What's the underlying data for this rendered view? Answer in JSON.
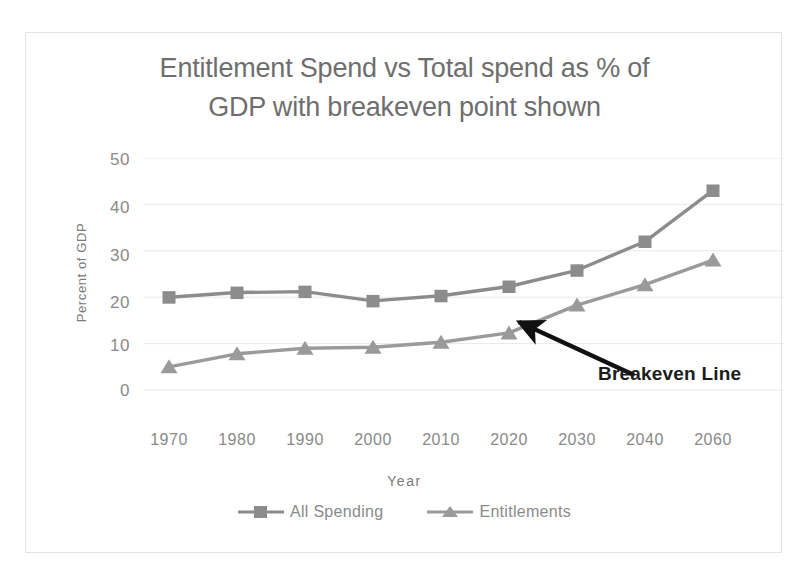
{
  "chart_data": {
    "type": "line",
    "title": "Entitlement Spend vs Total spend as % of GDP with breakeven point shown",
    "title_line1": "Entitlement Spend vs Total spend as % of",
    "title_line2": "GDP with breakeven point shown",
    "xlabel": "Year",
    "ylabel": "Percent of GDP",
    "categories": [
      "1970",
      "1980",
      "1990",
      "2000",
      "2010",
      "2020",
      "2030",
      "2040",
      "2060"
    ],
    "ylim": [
      0,
      50
    ],
    "yticks": [
      "50",
      "40",
      "30",
      "20",
      "10",
      "0"
    ],
    "ytick_values": [
      50,
      40,
      30,
      20,
      10,
      0
    ],
    "grid": true,
    "legend_position": "bottom",
    "series": [
      {
        "name": "All Spending",
        "marker": "square",
        "color": "#8c8c8c",
        "values": [
          20.0,
          21.0,
          21.2,
          19.2,
          20.3,
          22.3,
          25.8,
          32.0,
          43.0
        ]
      },
      {
        "name": "Entitlements",
        "marker": "triangle",
        "color": "#9a9a9a",
        "values": [
          5.0,
          7.8,
          9.0,
          9.2,
          10.3,
          12.3,
          18.3,
          22.7,
          28.0
        ]
      }
    ],
    "annotations": [
      {
        "text": "Breakeven Line",
        "color": "#1c1c1c",
        "points_to": "crossing region near 2020"
      }
    ]
  },
  "colors": {
    "series_all_spending": "#8c8c8c",
    "series_entitlements": "#9a9a9a",
    "gridline": "#e8e8e8",
    "axis_text": "#8a8a8a",
    "title_text": "#6e6e6e",
    "annotation": "#1c1c1c",
    "frame_border": "#e3e3e3",
    "background": "#ffffff"
  }
}
